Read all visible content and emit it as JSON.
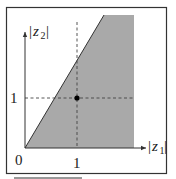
{
  "diagram": {
    "title": "",
    "axes": {
      "x_label": {
        "bar_open": "|",
        "var": "z",
        "sub": "1",
        "bar_close": "|"
      },
      "y_label": {
        "bar_open": "|",
        "var": "z",
        "sub": "2",
        "bar_close": "|"
      }
    },
    "ticks": {
      "origin": "0",
      "x_one": "1",
      "y_one": "1"
    },
    "point": {
      "x": 1,
      "y": 1
    },
    "region": {
      "description": "Shaded region bounded by the line |z2| = 2|z1| (left), the upper boundary, and a vertical right boundary",
      "fill_color": "#a9a9a9",
      "edge_color": "#333333"
    },
    "colors": {
      "frame": "#333333",
      "axis": "#333333",
      "dashed": "#444444",
      "point": "#000000",
      "background": "#ffffff"
    }
  }
}
